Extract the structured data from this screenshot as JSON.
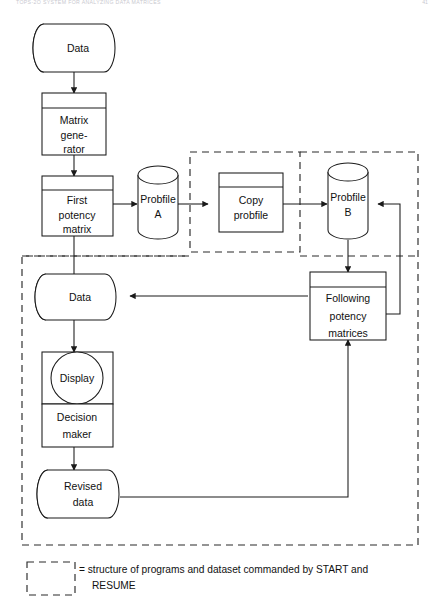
{
  "header": {
    "running_title": "TOPS-2O SYSTEM FOR ANALYZING DATA MATRICES",
    "page_number": "41"
  },
  "diagram": {
    "nodes": [
      {
        "id": "data_top",
        "label": "Data",
        "shape": "drum"
      },
      {
        "id": "matrixgen",
        "label": "Matrix gene- rator",
        "shape": "process",
        "lines": [
          "Matrix",
          "gene-",
          "rator"
        ]
      },
      {
        "id": "firstmatrix",
        "label": "First potency matrix",
        "shape": "process",
        "lines": [
          "First",
          "potency",
          "matrix"
        ]
      },
      {
        "id": "probfile_a",
        "label": "Probfile A",
        "shape": "disk",
        "lines": [
          "Probfile",
          "A"
        ]
      },
      {
        "id": "copyprob",
        "label": "Copy probfile",
        "shape": "process",
        "lines": [
          "Copy",
          "probfile"
        ]
      },
      {
        "id": "probfile_b",
        "label": "Probfile B",
        "shape": "disk",
        "lines": [
          "Probfile",
          "B"
        ]
      },
      {
        "id": "data_mid",
        "label": "Data",
        "shape": "drum"
      },
      {
        "id": "following",
        "label": "Following potency matrices",
        "shape": "process",
        "lines": [
          "Following",
          "potency",
          "matrices"
        ]
      },
      {
        "id": "display",
        "label": "Display",
        "shape": "display"
      },
      {
        "id": "decision",
        "label": "Decision maker",
        "shape": "process",
        "lines": [
          "Decision",
          "maker"
        ]
      },
      {
        "id": "revised",
        "label": "Revised data",
        "shape": "drum",
        "lines": [
          "Revised",
          "data"
        ]
      }
    ],
    "edges": [
      {
        "from": "data_top",
        "to": "matrixgen"
      },
      {
        "from": "matrixgen",
        "to": "firstmatrix"
      },
      {
        "from": "firstmatrix",
        "to": "probfile_a"
      },
      {
        "from": "firstmatrix",
        "to": "data_mid"
      },
      {
        "from": "probfile_a",
        "to": "copyprob"
      },
      {
        "from": "copyprob",
        "to": "probfile_b"
      },
      {
        "from": "probfile_b",
        "to": "following"
      },
      {
        "from": "following",
        "to": "probfile_b"
      },
      {
        "from": "following",
        "to": "data_mid"
      },
      {
        "from": "data_mid",
        "to": "display"
      },
      {
        "from": "display",
        "to": "decision"
      },
      {
        "from": "decision",
        "to": "revised"
      },
      {
        "from": "revised",
        "to": "following"
      }
    ],
    "dashed_regions": [
      {
        "id": "region_copy",
        "name": "copy-probfile-region"
      },
      {
        "id": "region_main",
        "name": "main-start-resume-region"
      }
    ]
  },
  "legend": {
    "swatch_name": "dashed-box-swatch",
    "line1": "= structure of programs and dataset commanded by START and",
    "line2": "RESUME"
  }
}
